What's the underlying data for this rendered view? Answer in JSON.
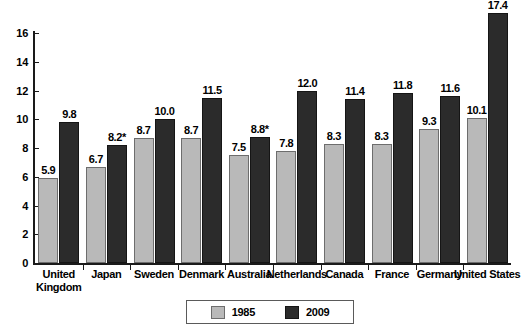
{
  "chart_data": {
    "type": "bar",
    "title": "",
    "subtitle": "",
    "xlabel": "",
    "ylabel": "",
    "ylim": [
      0,
      16
    ],
    "ytick_values": [
      16,
      14,
      12,
      10,
      8,
      6,
      4,
      2,
      0
    ],
    "ytick_labels": [
      "16",
      "14",
      "12",
      "10",
      "8",
      "6",
      "4",
      "2",
      "0"
    ],
    "grid": false,
    "legend_position": "bottom-center",
    "categories": [
      "United Kingdom",
      "Japan",
      "Sweden",
      "Denmark",
      "Australia",
      "Netherlands",
      "Canada",
      "France",
      "Germany",
      "United States"
    ],
    "category_lines": [
      [
        "United",
        "Kingdom"
      ],
      [
        "Japan"
      ],
      [
        "Sweden"
      ],
      [
        "Denmark"
      ],
      [
        "Australia"
      ],
      [
        "Netherlands"
      ],
      [
        "Canada"
      ],
      [
        "France"
      ],
      [
        "Germany"
      ],
      [
        "United States"
      ]
    ],
    "series": [
      {
        "name": "1985",
        "color": "#b9b9b9",
        "values": [
          5.9,
          6.7,
          8.7,
          8.7,
          7.5,
          7.8,
          8.3,
          8.3,
          9.3,
          10.1
        ],
        "labels": [
          "5.9",
          "6.7",
          "8.7",
          "8.7",
          "7.5",
          "7.8",
          "8.3",
          "8.3",
          "9.3",
          "10.1"
        ]
      },
      {
        "name": "2009",
        "color": "#2b2b2b",
        "values": [
          9.8,
          8.2,
          10.0,
          11.5,
          8.8,
          12.0,
          11.4,
          11.8,
          11.6,
          17.4
        ],
        "labels": [
          "9.8",
          "8.2*",
          "10.0",
          "11.5",
          "8.8*",
          "12.0",
          "11.4",
          "11.8",
          "11.6",
          "17.4"
        ]
      }
    ],
    "footnotes": [
      "* Values marked with an asterisk"
    ]
  },
  "legend": {
    "entries": [
      {
        "label": "1985",
        "swatch": "light-swatch"
      },
      {
        "label": "2009",
        "swatch": "dark-swatch"
      }
    ]
  }
}
